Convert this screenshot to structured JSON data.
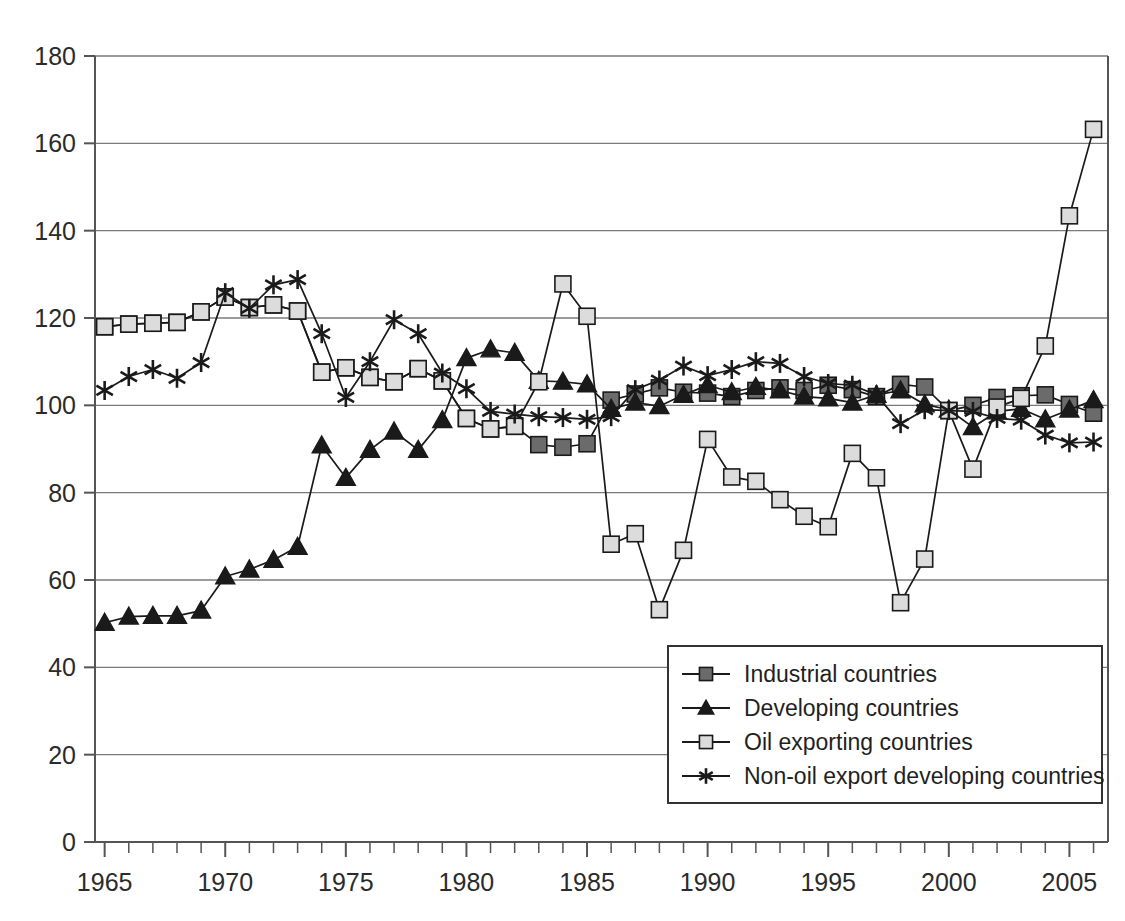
{
  "chart_data": {
    "type": "line",
    "title": "",
    "subtitle": "",
    "xlabel": "",
    "ylabel": "",
    "xlim": [
      1964.6,
      2006.6
    ],
    "ylim": [
      0,
      180
    ],
    "grid": true,
    "grid_axis": "y",
    "legend_position": "bottom-right",
    "y_ticks": [
      0,
      20,
      40,
      60,
      80,
      100,
      120,
      140,
      160,
      180
    ],
    "y_tick_labels": [
      "0",
      "20",
      "40",
      "60",
      "80",
      "100",
      "120",
      "140",
      "160",
      "180"
    ],
    "x_ticks": [
      1965,
      1966,
      1967,
      1968,
      1969,
      1970,
      1971,
      1972,
      1973,
      1974,
      1975,
      1976,
      1977,
      1978,
      1979,
      1980,
      1981,
      1982,
      1983,
      1984,
      1985,
      1986,
      1987,
      1988,
      1989,
      1990,
      1991,
      1992,
      1993,
      1994,
      1995,
      1996,
      1997,
      1998,
      1999,
      2000,
      2001,
      2002,
      2003,
      2004,
      2005,
      2006
    ],
    "x_tick_labels_shown": [
      "1965",
      "1970",
      "1975",
      "1980",
      "1985",
      "1990",
      "1995",
      "2000",
      "2005"
    ],
    "x": [
      1965,
      1966,
      1967,
      1968,
      1969,
      1970,
      1971,
      1972,
      1973,
      1974,
      1975,
      1976,
      1977,
      1978,
      1979,
      1980,
      1981,
      1982,
      1983,
      1984,
      1985,
      1986,
      1987,
      1988,
      1989,
      1990,
      1991,
      1992,
      1993,
      1994,
      1995,
      1996,
      1997,
      1998,
      1999,
      2000,
      2001,
      2002,
      2003,
      2004,
      2005,
      2006
    ],
    "series": [
      {
        "name": "Industrial countries",
        "marker": "filled-square",
        "color": "#6b6b6b",
        "edge_color": "#1a1a1a",
        "values": [
          118.0,
          118.6,
          118.8,
          119.0,
          121.4,
          124.8,
          122.4,
          123.0,
          121.6,
          107.6,
          108.6,
          106.4,
          105.4,
          108.4,
          105.6,
          97.0,
          94.6,
          95.2,
          91.0,
          90.4,
          91.2,
          101.2,
          102.6,
          104.0,
          103.0,
          102.8,
          102.0,
          103.4,
          104.0,
          103.4,
          104.6,
          103.6,
          102.0,
          104.8,
          104.2,
          98.8,
          100.0,
          101.8,
          102.2,
          102.4,
          100.2,
          98.2
        ]
      },
      {
        "name": "Developing countries",
        "marker": "filled-triangle",
        "color": "#1a1a1a",
        "edge_color": "#1a1a1a",
        "values": [
          50.2,
          51.6,
          51.8,
          51.8,
          53.0,
          60.8,
          62.4,
          64.6,
          67.6,
          90.8,
          83.4,
          89.8,
          94.0,
          89.8,
          96.6,
          110.8,
          112.8,
          112.0,
          105.6,
          105.4,
          104.8,
          99.2,
          100.6,
          99.8,
          102.4,
          104.6,
          103.0,
          104.2,
          103.4,
          102.0,
          101.6,
          100.6,
          102.4,
          103.4,
          100.2,
          99.0,
          95.0,
          98.6,
          99.2,
          96.8,
          99.0,
          101.2
        ]
      },
      {
        "name": "Oil exporting countries",
        "marker": "open-square",
        "color": "#dcdcdc",
        "edge_color": "#1a1a1a",
        "values": [
          118.0,
          118.6,
          118.8,
          119.0,
          121.4,
          124.8,
          122.4,
          123.0,
          121.6,
          107.6,
          108.6,
          106.4,
          105.4,
          108.4,
          105.6,
          97.0,
          94.6,
          95.2,
          105.4,
          127.8,
          120.4,
          68.2,
          70.6,
          53.2,
          66.8,
          92.2,
          83.6,
          82.6,
          78.4,
          74.6,
          72.2,
          89.0,
          83.4,
          54.8,
          64.8,
          98.8,
          85.4,
          99.6,
          101.6,
          113.6,
          143.4,
          163.2
        ]
      },
      {
        "name": "Non-oil export developing countries",
        "marker": "asterisk",
        "color": "#1a1a1a",
        "edge_color": "#1a1a1a",
        "values": [
          103.4,
          106.6,
          108.2,
          106.2,
          109.8,
          125.8,
          122.2,
          127.6,
          128.8,
          116.4,
          101.8,
          110.0,
          119.6,
          116.4,
          107.4,
          103.8,
          98.6,
          98.0,
          97.4,
          97.2,
          96.8,
          97.4,
          103.6,
          105.8,
          109.0,
          106.8,
          108.2,
          110.0,
          109.6,
          106.6,
          105.0,
          104.6,
          102.4,
          95.8,
          99.0,
          98.8,
          98.6,
          97.0,
          96.6,
          93.2,
          91.4,
          91.6
        ]
      }
    ]
  },
  "legend": {
    "entries": [
      {
        "label": "Industrial countries"
      },
      {
        "label": "Developing countries"
      },
      {
        "label": "Oil exporting countries"
      },
      {
        "label": "Non-oil export developing countries"
      }
    ]
  }
}
